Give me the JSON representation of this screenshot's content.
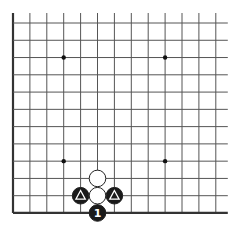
{
  "board": {
    "columns": 13,
    "rows": 12,
    "origin_x": 13,
    "origin_y": 23,
    "spacing_x": 16.9,
    "spacing_y": 17.27,
    "line_extend_top": 10,
    "line_extend_right": 12,
    "edges": [
      "left",
      "bottom"
    ],
    "colors": {
      "background": "#ffffff",
      "grid": "#555555",
      "edge": "#333333",
      "black_stone": "#1a1a1a",
      "white_stone": "#ffffff",
      "stone_outline": "#222222",
      "marker_on_black": "#ffffff"
    }
  },
  "star_points": [
    {
      "col": 3,
      "row": 2
    },
    {
      "col": 9,
      "row": 2
    },
    {
      "col": 3,
      "row": 8
    },
    {
      "col": 9,
      "row": 8
    }
  ],
  "stones": [
    {
      "color": "white",
      "col": 5,
      "row": 9,
      "marker": null
    },
    {
      "color": "white",
      "col": 5,
      "row": 10,
      "marker": null
    },
    {
      "color": "black",
      "col": 4,
      "row": 10,
      "marker": "triangle"
    },
    {
      "color": "black",
      "col": 6,
      "row": 10,
      "marker": "triangle"
    },
    {
      "color": "black",
      "col": 5,
      "row": 11,
      "marker": "label",
      "label": "1"
    }
  ]
}
